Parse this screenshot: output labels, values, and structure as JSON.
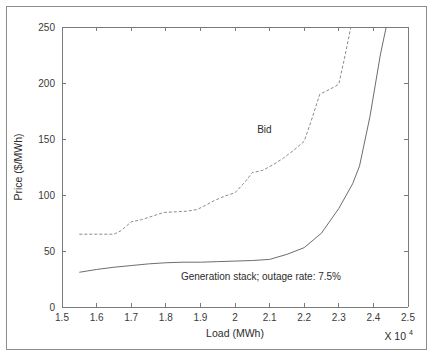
{
  "figure": {
    "background_color": "#ffffff",
    "border_color": "#8c8c8c",
    "axis_color": "#7a7a7a"
  },
  "chart_data": {
    "type": "line",
    "title": "",
    "xlabel": "Load (MWh)",
    "ylabel": "Price ($/MWh)",
    "x_exponent_base": "X 10",
    "x_exponent_power": "4",
    "xlim": [
      1.5,
      2.5
    ],
    "ylim": [
      0,
      250
    ],
    "xticks": [
      "1.5",
      "1.6",
      "1.7",
      "1.8",
      "1.9",
      "2",
      "2.1",
      "2.2",
      "2.3",
      "2.4",
      "2.5"
    ],
    "xtick_values": [
      1.5,
      1.6,
      1.7,
      1.8,
      1.9,
      2.0,
      2.1,
      2.2,
      2.3,
      2.4,
      2.5
    ],
    "yticks": [
      "0",
      "50",
      "100",
      "150",
      "200",
      "250"
    ],
    "ytick_values": [
      0,
      50,
      100,
      150,
      200,
      250
    ],
    "grid": false,
    "legend_position": "inline-annotations",
    "series": [
      {
        "name": "Bid",
        "style": "dashed",
        "color": "#8a8a8a",
        "x": [
          1.55,
          1.6,
          1.65,
          1.67,
          1.7,
          1.73,
          1.76,
          1.79,
          1.8,
          1.83,
          1.86,
          1.89,
          1.91,
          1.94,
          1.97,
          2.0,
          2.03,
          2.05,
          2.08,
          2.11,
          2.14,
          2.17,
          2.2,
          2.22,
          2.245,
          2.265,
          2.29,
          2.3,
          2.315,
          2.335
        ],
        "y": [
          65,
          65,
          65,
          68,
          76,
          78,
          81,
          84,
          84.5,
          85,
          85.5,
          87,
          90,
          95,
          99,
          102,
          112,
          120,
          122,
          127,
          133,
          140,
          148,
          166,
          190,
          193,
          197,
          199,
          220,
          250
        ]
      },
      {
        "name": "Generation stack; outage rate: 7.5%",
        "style": "solid",
        "color": "#6d6d6d",
        "x": [
          1.55,
          1.6,
          1.65,
          1.7,
          1.75,
          1.8,
          1.85,
          1.9,
          1.95,
          2.0,
          2.05,
          2.1,
          2.15,
          2.2,
          2.25,
          2.3,
          2.34,
          2.36,
          2.39,
          2.42,
          2.437
        ],
        "y": [
          31,
          33.5,
          35.5,
          37,
          38.5,
          39.5,
          40,
          40,
          40.5,
          41,
          41.5,
          42.5,
          47,
          53,
          66,
          88,
          110,
          126,
          170,
          225,
          250
        ]
      }
    ],
    "annotations": [
      {
        "name": "bid-label",
        "text": "Bid",
        "x": 2.085,
        "y": 155
      },
      {
        "name": "generation-stack-label",
        "text": "Generation stack; outage rate: 7.5%",
        "x": 2.075,
        "y": 24
      }
    ]
  }
}
